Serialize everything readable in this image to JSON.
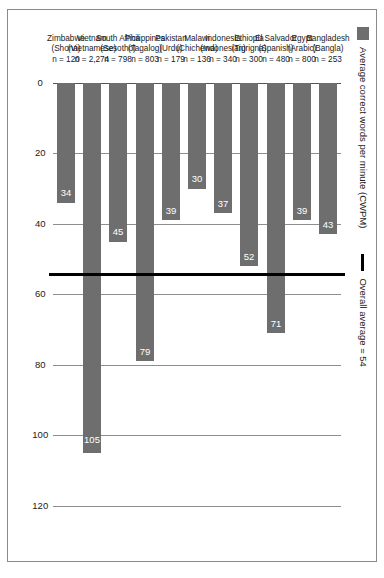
{
  "figure": {
    "legend": {
      "bar_series_label": "Average correct words per minute (CWPM)",
      "average_line_label": "Overall average = 54",
      "bar_swatch_name": "bar-series-swatch",
      "line_swatch_name": "average-line-swatch"
    },
    "colors": {
      "bar_fill": "#6e6e6e",
      "average_line": "#000000",
      "gridline": "#8e8e8e",
      "border": "#8a8a8a",
      "value_label_text": "#ffffff",
      "axis_text": "#1a1a1a"
    }
  },
  "chart_data": {
    "type": "bar",
    "title": "",
    "subtitle": "",
    "orientation": "vertical",
    "xlabel": "",
    "ylabel": "Average correct words per minute (CWPM)",
    "ylim": [
      0,
      130
    ],
    "grid": true,
    "legend_position": "top-left",
    "tick_labels": [
      "0",
      "20",
      "40",
      "60",
      "80",
      "100",
      "120"
    ],
    "ticks": [
      0,
      20,
      40,
      60,
      80,
      100,
      120
    ],
    "categories": [
      "Bangladesh (Bangla) n = 253",
      "Egypt (Arabic) n = 800",
      "El Salvador (Spanish) n = 480",
      "Ethiopia (Tigrigna) n = 300",
      "Indonesia (Indonesian) n = 340",
      "Malawi (Chichewa) n = 136",
      "Pakistan (Urdu) n = 179",
      "Philippines (Tagalog) n = 803",
      "South Africa (Sesotho) n = 798",
      "Vietnam (Vietnamese) n = 2,274",
      "Zimbabwe (Shona) n = 120"
    ],
    "values": [
      43,
      39,
      71,
      52,
      37,
      30,
      39,
      79,
      45,
      105,
      34
    ],
    "value_labels": [
      "43",
      "39",
      "71",
      "52",
      "37",
      "30",
      "39",
      "79",
      "45",
      "105",
      "34"
    ],
    "series": [
      {
        "name": "Average correct words per minute (CWPM)",
        "values": [
          43,
          39,
          71,
          52,
          37,
          30,
          39,
          79,
          45,
          105,
          34
        ]
      }
    ],
    "reference_line": {
      "label": "Overall average = 54",
      "value": 54
    },
    "category_details": [
      {
        "country": "Bangladesh",
        "language": "(Bangla)",
        "n": "n = 253"
      },
      {
        "country": "Egypt",
        "language": "(Arabic)",
        "n": "n = 800"
      },
      {
        "country": "El Salvador",
        "language": "(Spanish)",
        "n": "n = 480"
      },
      {
        "country": "Ethiopia",
        "language": "(Tigrigna)",
        "n": "n = 300"
      },
      {
        "country": "Indonesia",
        "language": "(Indonesian)",
        "n": "n = 340"
      },
      {
        "country": "Malawi",
        "language": "(Chichewa)",
        "n": "n = 136"
      },
      {
        "country": "Pakistan",
        "language": "(Urdu)",
        "n": "n = 179"
      },
      {
        "country": "Philippines",
        "language": "(Tagalog)",
        "n": "n = 803"
      },
      {
        "country": "South Africa",
        "language": "(Sesotho)",
        "n": "n = 798"
      },
      {
        "country": "Vietnam",
        "language": "(Vietnamese)",
        "n": "n = 2,274"
      },
      {
        "country": "Zimbabwe",
        "language": "(Shona)",
        "n": "n = 120"
      }
    ]
  }
}
